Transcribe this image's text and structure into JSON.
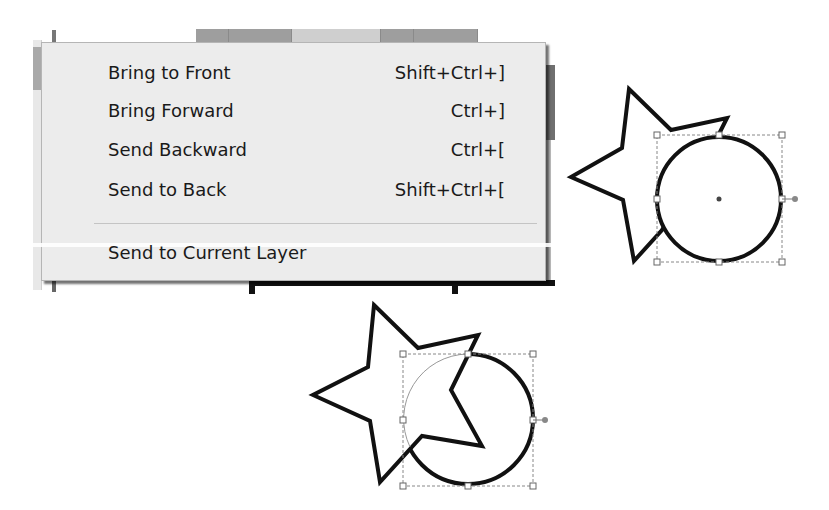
{
  "context_menu": {
    "items": [
      {
        "label": "Bring to Front",
        "shortcut": "Shift+Ctrl+]"
      },
      {
        "label": "Bring Forward",
        "shortcut": "Ctrl+]"
      },
      {
        "label": "Send Backward",
        "shortcut": "Ctrl+["
      },
      {
        "label": "Send to Back",
        "shortcut": "Shift+Ctrl+["
      },
      {
        "label": "Send to Current Layer",
        "shortcut": ""
      }
    ]
  },
  "illustration": {
    "before": {
      "description": "star behind selected circle",
      "selected": "circle"
    },
    "after": {
      "description": "star brought in front of selected circle",
      "selected": "circle"
    }
  },
  "colors": {
    "menu_bg": "#ececec",
    "text": "#1a1a1a",
    "shape_stroke": "#111111",
    "selection_box": "#888888"
  }
}
